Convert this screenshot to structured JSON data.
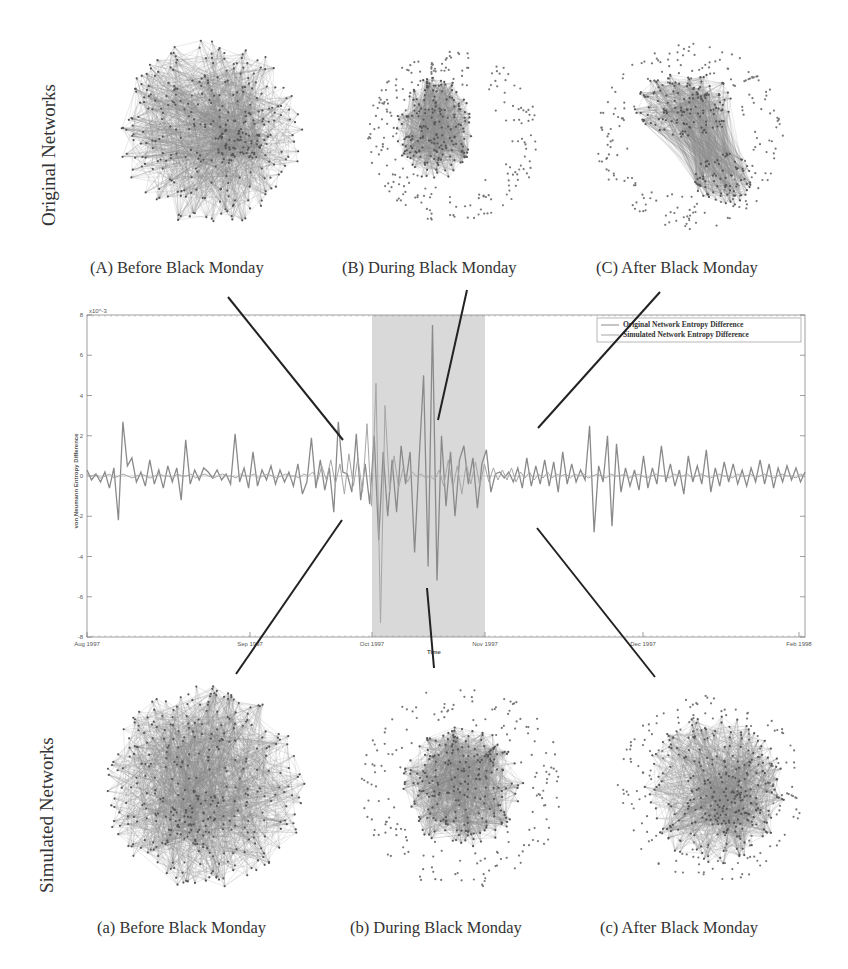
{
  "figure": {
    "row_labels": {
      "top": "Original Networks",
      "bottom": "Simulated Networks"
    },
    "top_captions": [
      "(A) Before Black Monday",
      "(B) During Black Monday",
      "(C) After Black Monday"
    ],
    "bottom_captions": [
      "(a)  Before Black Monday",
      "(b)  During Black Monday",
      "(c) After Black Monday"
    ]
  },
  "chart_data": {
    "type": "line",
    "title": "",
    "xlabel": "Time",
    "ylabel": "von Neumann Entropy Difference",
    "y_exponent": "x10^-3",
    "ylim": [
      -8,
      8
    ],
    "yticks": [
      8,
      6,
      4,
      2,
      0,
      -2,
      -4,
      -6,
      -8
    ],
    "xticks": [
      "Aug 1997",
      "Sep 1997",
      "Oct 1997",
      "Nov 1997",
      "Dec 1997",
      "Feb 1998"
    ],
    "highlight_region": {
      "label": "Black Monday period",
      "start": "Oct 1997",
      "end": "Nov 1997",
      "color": "#d9d9d9"
    },
    "grid": false,
    "legend_position": "upper right",
    "legend": [
      "Original Network Entropy Difference",
      "Simulated Network Entropy Difference"
    ],
    "series": [
      {
        "name": "Original Network Entropy Difference",
        "color": "#8a8a8a",
        "values": [
          0.3,
          -0.2,
          0.1,
          -0.3,
          0.2,
          -0.6,
          0.4,
          -2.2,
          2.7,
          0.5,
          0.9,
          -0.3,
          0.2,
          -0.5,
          0.8,
          -0.4,
          0.3,
          -0.6,
          0.5,
          -0.3,
          0.4,
          -1.2,
          1.8,
          -0.4,
          0.3,
          -0.2,
          0.4,
          0.2,
          -0.1,
          0.3,
          -0.2,
          0.1,
          -0.4,
          2.1,
          -0.3,
          0.4,
          -0.6,
          1.2,
          -0.5,
          0.3,
          -0.2,
          0.5,
          -0.4,
          0.3,
          -0.3,
          0.2,
          -0.5,
          0.6,
          -0.9,
          -0.3,
          1.9,
          -0.6,
          0.8,
          -0.7,
          0.4,
          -1.8,
          2.7,
          0.2,
          0.1,
          -0.8,
          2.1,
          -1.2,
          0.6,
          -1.4,
          2.0,
          -3.2,
          1.2,
          -2.0,
          0.8,
          -1.8,
          1.5,
          -0.4,
          1.2,
          -3.8,
          0.8,
          5.0,
          -4.5,
          7.5,
          -5.2,
          2.0,
          -1.5,
          1.2,
          -2.0,
          0.8,
          1.5,
          -0.4,
          0.9,
          -1.6,
          0.6,
          1.3,
          -0.8,
          0.1,
          0.2,
          -0.1,
          0.2,
          -0.3,
          0.4,
          -0.6,
          0.9,
          -0.5,
          0.5,
          -0.4,
          0.8,
          -0.5,
          0.7,
          -0.8,
          1.2,
          -0.4,
          0.6,
          -0.3,
          0.3,
          -0.2,
          2.5,
          -2.8,
          0.5,
          -0.3,
          2.0,
          -2.5,
          1.6,
          -0.8,
          0.4,
          -0.5,
          0.3,
          -0.7,
          1.0,
          -0.6,
          0.4,
          -0.4,
          1.5,
          -0.3,
          0.6,
          -0.5,
          0.3,
          -0.9,
          1.0,
          -0.3,
          0.5,
          -0.4,
          1.3,
          -0.8,
          0.4,
          -0.5,
          0.7,
          -0.3,
          0.6,
          -0.4,
          0.3,
          -0.5,
          0.4,
          -0.3,
          0.8,
          -0.4,
          0.6,
          -0.6,
          0.4,
          -0.3,
          0.5,
          -0.2,
          0.4,
          -0.3,
          0.2
        ],
        "note": "values are approximate readings in units of 1e-3"
      },
      {
        "name": "Simulated Network Entropy Difference",
        "color": "#a6a6a6",
        "values": [
          0.1,
          0.0,
          0.1,
          -0.1,
          0.0,
          0.1,
          -0.1,
          0.0,
          0.1,
          0.0,
          -0.1,
          0.0,
          0.1,
          0.0,
          -0.1,
          0.0,
          0.1,
          0.0,
          0.0,
          -0.1,
          0.1,
          0.0,
          0.0,
          0.1,
          -0.1,
          0.0,
          0.1,
          0.0,
          -0.1,
          0.0,
          0.1,
          0.0,
          0.0,
          -0.1,
          0.1,
          0.0,
          0.0,
          0.1,
          -0.1,
          0.0,
          0.1,
          0.0,
          -0.1,
          0.0,
          0.1,
          0.0,
          0.0,
          -0.1,
          0.1,
          0.0,
          0.2,
          -0.3,
          0.5,
          -0.2,
          0.8,
          -0.4,
          0.6,
          -0.9,
          1.1,
          -0.5,
          0.9,
          -0.8,
          2.6,
          -1.5,
          4.6,
          -7.3,
          3.5,
          -0.8,
          1.0,
          -0.6,
          0.4,
          -0.3,
          0.2,
          0.0,
          0.1,
          -0.1,
          0.0,
          -0.2,
          0.3,
          -0.5,
          0.8,
          -0.6,
          0.5,
          -0.9,
          0.6,
          -0.4,
          0.7,
          -0.5,
          0.6,
          -0.3,
          0.4,
          -0.2,
          0.3,
          -0.2,
          0.4,
          -0.3,
          0.2,
          -0.1,
          0.2,
          -0.2,
          0.1,
          -0.1,
          0.2,
          -0.1,
          0.1,
          0.0,
          0.1,
          -0.1,
          0.1,
          0.0,
          0.1,
          -0.1,
          0.0,
          0.1,
          0.0,
          -0.1,
          0.1,
          0.0,
          0.0,
          0.1,
          -0.1,
          0.0,
          0.1,
          0.0,
          -0.1,
          0.0,
          0.1,
          0.0,
          0.0,
          -0.1,
          0.1,
          0.0,
          0.0,
          0.1,
          -0.1,
          0.0,
          0.1,
          0.0,
          -0.1,
          0.0,
          0.1,
          0.0,
          0.0,
          -0.1,
          0.1,
          0.0,
          0.0,
          0.1,
          -0.1,
          0.0,
          0.1,
          0.0,
          -0.1,
          0.0,
          0.1,
          0.0,
          0.0,
          -0.1,
          0.1,
          0.0
        ]
      }
    ]
  }
}
